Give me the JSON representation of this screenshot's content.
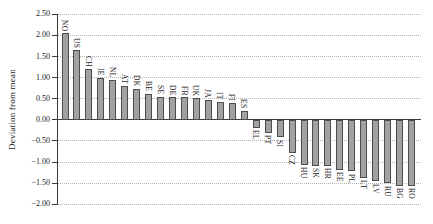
{
  "chart_data": {
    "type": "bar",
    "title": "",
    "xlabel": "",
    "ylabel": "Deviation from mean",
    "categories": [
      "NO",
      "US",
      "CH",
      "IE",
      "NL",
      "AT",
      "DK",
      "BE",
      "SE",
      "DE",
      "FR",
      "UK",
      "JA",
      "IT",
      "FI",
      "ES",
      "EL",
      "PT",
      "SI",
      "CZ",
      "HU",
      "SK",
      "HR",
      "EE",
      "PL",
      "LT",
      "LV",
      "RU",
      "BG",
      "RO"
    ],
    "values": [
      2.05,
      1.65,
      1.2,
      1.0,
      0.95,
      0.8,
      0.74,
      0.62,
      0.55,
      0.53,
      0.53,
      0.51,
      0.47,
      0.42,
      0.39,
      0.22,
      -0.18,
      -0.3,
      -0.4,
      -0.77,
      -1.05,
      -1.08,
      -1.08,
      -1.17,
      -1.21,
      -1.36,
      -1.44,
      -1.49,
      -1.55,
      -1.55
    ],
    "ylim": [
      -2.0,
      2.5
    ],
    "ytick_values": [
      2.5,
      2.0,
      1.5,
      1.0,
      0.5,
      0.0,
      -0.5,
      -1.0,
      -1.5,
      -2.0
    ],
    "ytick_labels": [
      "2.50",
      "2.00",
      "1.50",
      "1.00",
      "0.50",
      "0.00",
      "−0.50",
      "−1.00",
      "−1.50",
      "−2.00"
    ],
    "grid": "horizontal-dotted",
    "legend": "none",
    "bar_fill": "#a1a1a1",
    "bar_border": "#4d4d4d",
    "gridline_color": "#b4b4b4",
    "axis_color": "#3a3a3a"
  }
}
